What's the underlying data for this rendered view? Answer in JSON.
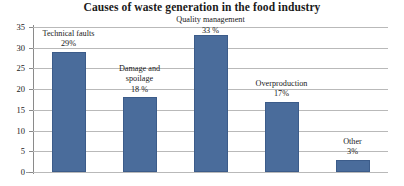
{
  "chart_data": {
    "type": "bar",
    "title": "Causes of waste generation in the food industry",
    "xlabel": "",
    "ylabel": "",
    "ylim": [
      0,
      35
    ],
    "ytick_step": 5,
    "yticks": [
      "0",
      "5",
      "10",
      "15",
      "20",
      "25",
      "30",
      "35"
    ],
    "grid": true,
    "legend": "none",
    "bar_color": "#4a6c9b",
    "categories": [
      "Technical faults",
      "Damage and spoilage",
      "Quality management",
      "Overproduction",
      "Other"
    ],
    "values": [
      29,
      18,
      33,
      17,
      3
    ],
    "data_labels": [
      "29%",
      "18 %",
      "33 %",
      "17%",
      "3%"
    ],
    "points": [
      {
        "category": "Technical faults",
        "value": 29,
        "label_name": "Technical faults",
        "label_pct": "29%",
        "label_lines": [
          "Technical faults"
        ]
      },
      {
        "category": "Damage and spoilage",
        "value": 18,
        "label_name": "Damage and spoilage",
        "label_pct": "18 %",
        "label_lines": [
          "Damage and",
          "spoilage"
        ]
      },
      {
        "category": "Quality management",
        "value": 33,
        "label_name": "Quality management",
        "label_pct": "33 %",
        "label_lines": [
          "Quality management"
        ]
      },
      {
        "category": "Overproduction",
        "value": 17,
        "label_name": "Overproduction",
        "label_pct": "17%",
        "label_lines": [
          "Overproduction"
        ]
      },
      {
        "category": "Other",
        "value": 3,
        "label_name": "Other",
        "label_pct": "3%",
        "label_lines": [
          "Other"
        ]
      }
    ]
  }
}
